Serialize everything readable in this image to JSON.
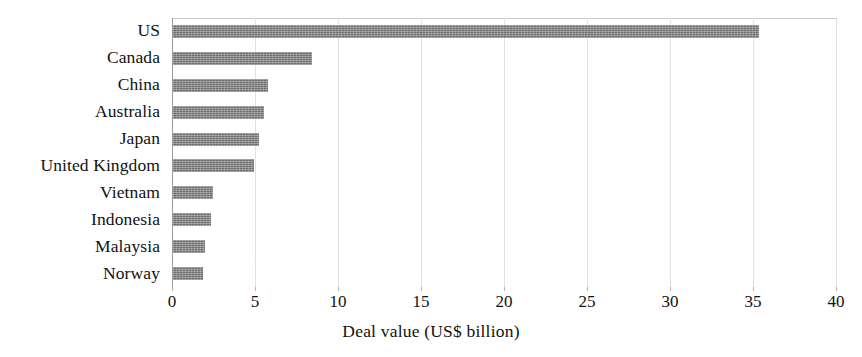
{
  "chart_data": {
    "type": "bar",
    "orientation": "horizontal",
    "title": "",
    "xlabel": "Deal value (US$ billion)",
    "ylabel": "",
    "xlim": [
      0,
      40
    ],
    "xticks": [
      0,
      5,
      10,
      15,
      20,
      25,
      30,
      35,
      40
    ],
    "xtick_labels": [
      "0",
      "5",
      "10",
      "15",
      "20",
      "25",
      "30",
      "35",
      "40"
    ],
    "grid": "vertical-light",
    "legend": "none",
    "bar_color": "#868686",
    "categories": [
      "US",
      "Canada",
      "China",
      "Australia",
      "Japan",
      "United Kingdom",
      "Vietnam",
      "Indonesia",
      "Malaysia",
      "Norway"
    ],
    "values": [
      35.3,
      8.4,
      5.7,
      5.5,
      5.2,
      4.9,
      2.4,
      2.3,
      1.9,
      1.8
    ]
  }
}
